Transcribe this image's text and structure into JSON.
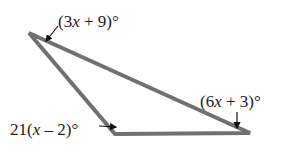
{
  "diagram": {
    "type": "triangle",
    "stroke_color": "#707070",
    "text_color": "#222222",
    "vertices": {
      "top_left": {
        "x": 29,
        "y": 33
      },
      "bottom_left": {
        "x": 115,
        "y": 134
      },
      "bottom_right": {
        "x": 250,
        "y": 133
      }
    },
    "angles": {
      "top_left": {
        "expr_prefix": "(3",
        "var": "x",
        "expr_suffix": " + 9)°"
      },
      "bottom_left": {
        "expr_prefix": "21(",
        "var": "x",
        "expr_suffix": " – 2)°"
      },
      "bottom_right": {
        "expr_prefix": "(6",
        "var": "x",
        "expr_suffix": " + 3)°"
      }
    }
  }
}
